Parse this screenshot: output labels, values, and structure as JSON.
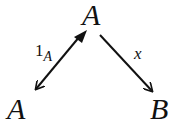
{
  "diagram": {
    "nodes": {
      "top": "A",
      "left": "A",
      "right": "B"
    },
    "edges": [
      {
        "from": "top",
        "to": "left",
        "label_main": "1",
        "label_sub": "A",
        "tail": "filled-triangle"
      },
      {
        "from": "top",
        "to": "right",
        "label_main": "x"
      }
    ],
    "colors": {
      "stroke": "#111111",
      "background": "#ffffff"
    }
  }
}
